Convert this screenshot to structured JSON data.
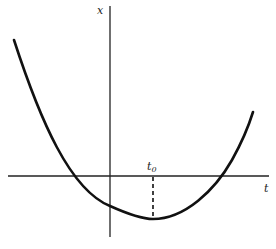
{
  "diagram": {
    "type": "function-plot",
    "axes": {
      "vertical_label": "x",
      "horizontal_label": "t"
    },
    "marker": {
      "label": "t",
      "subscript": "0",
      "style": "dashed vertical line from t-axis to curve minimum"
    },
    "colors": {
      "stroke": "#111111",
      "background": "#ffffff"
    }
  }
}
